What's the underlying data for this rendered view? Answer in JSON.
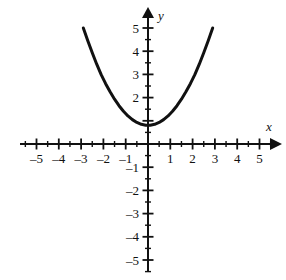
{
  "chart_data": {
    "type": "line",
    "title": "",
    "subtitle": "",
    "xlabel": "x",
    "ylabel": "y",
    "xlim": [
      -5.6,
      5.6
    ],
    "ylim": [
      -5.6,
      5.6
    ],
    "grid": false,
    "legend": null,
    "x_ticks": [
      -5,
      -4,
      -3,
      -2,
      -1,
      1,
      2,
      3,
      4,
      5
    ],
    "y_ticks": [
      5,
      4,
      3,
      2,
      -1,
      -2,
      -3,
      -4,
      -5
    ],
    "x_tick_labels": [
      "–5",
      "–4",
      "–3",
      "–2",
      "–1",
      "1",
      "2",
      "3",
      "4",
      "5"
    ],
    "y_tick_labels": [
      "5",
      "4",
      "3",
      "2",
      "–1",
      "–2",
      "–3",
      "–4",
      "–5"
    ],
    "minor_tick_step": 0.5,
    "axis_color": "#111111",
    "curve_color": "#111111",
    "series": [
      {
        "name": "parabola",
        "equation": "y = 0.5x^2 + 0.8",
        "vertex": [
          0,
          0.8
        ],
        "x": [
          -2.9,
          -2.7,
          -2.5,
          -2.3,
          -2.1,
          -1.9,
          -1.7,
          -1.5,
          -1.3,
          -1.1,
          -0.9,
          -0.7,
          -0.5,
          -0.3,
          -0.1,
          0.1,
          0.3,
          0.5,
          0.7,
          0.9,
          1.1,
          1.3,
          1.5,
          1.7,
          1.9,
          2.1,
          2.3,
          2.5,
          2.7,
          2.9
        ],
        "y": [
          5.0,
          4.45,
          3.93,
          3.44,
          2.99,
          2.6,
          2.25,
          1.93,
          1.65,
          1.41,
          1.21,
          1.05,
          0.93,
          0.85,
          0.81,
          0.81,
          0.85,
          0.93,
          1.05,
          1.21,
          1.41,
          1.65,
          1.93,
          2.25,
          2.6,
          2.99,
          3.44,
          3.93,
          4.45,
          5.0
        ]
      }
    ]
  },
  "labels": {
    "x_axis_name": "x",
    "y_axis_name": "y"
  }
}
